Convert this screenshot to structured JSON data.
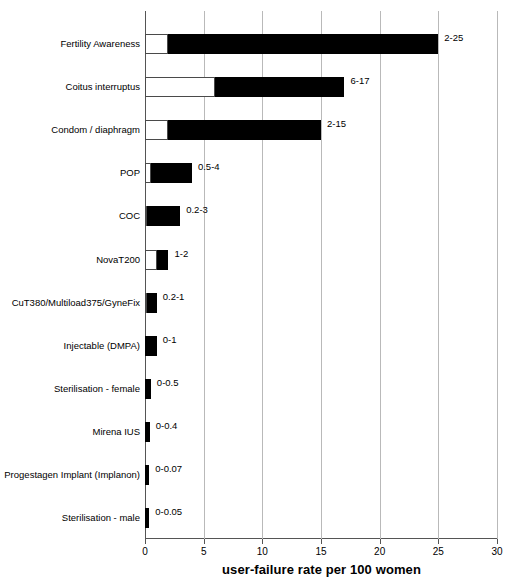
{
  "chart_data": {
    "type": "bar",
    "orientation": "horizontal",
    "title": "",
    "subtitle": "",
    "xlabel": "user-failure rate per 100 women",
    "ylabel": "",
    "xlim": [
      0,
      30
    ],
    "xticks": [
      0,
      5,
      10,
      15,
      20,
      25,
      30
    ],
    "xticklabels": [
      "0",
      "5",
      "10",
      "15",
      "20",
      "25",
      "30"
    ],
    "grid": true,
    "grid_axis": "x",
    "legend": "none",
    "categories": [
      "Fertility Awareness",
      "Coitus interruptus",
      "Condom / diaphragm",
      "POP",
      "COC",
      "NovaT200",
      "CuT380/Multiload375/GyneFix",
      "Injectable (DMPA)",
      "Sterilisation - female",
      "Mirena IUS",
      "Progestagen Implant (Implanon)",
      "Sterilisation - male"
    ],
    "series": [
      {
        "name": "low (white segment, 0 to min)",
        "values": [
          2,
          6,
          2,
          0.5,
          0.2,
          1,
          0.2,
          0,
          0,
          0,
          0,
          0
        ]
      },
      {
        "name": "high (black segment, min to max)",
        "values": [
          25,
          17,
          15,
          4,
          3,
          2,
          1,
          1,
          0.5,
          0.4,
          0.07,
          0.05
        ]
      }
    ],
    "data_labels": [
      "2-25",
      "6-17",
      "2-15",
      "0.5-4",
      "0.2-3",
      "1-2",
      "0.2-1",
      "0-1",
      "0-0.5",
      "0-0.4",
      "0-0.07",
      "0-0.05"
    ],
    "colors": {
      "low_fill": "#ffffff",
      "low_stroke": "#4a4a4a",
      "high_fill": "#000000",
      "axis": "#555555",
      "grid": "#b9b9b9",
      "background": "#ffffff",
      "text": "#000000"
    }
  }
}
